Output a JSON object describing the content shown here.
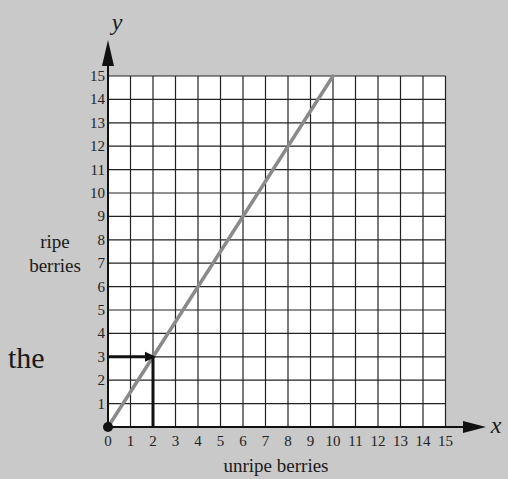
{
  "chart_data": {
    "type": "line",
    "title": "",
    "xlabel": "unripe berries",
    "ylabel": "ripe berries",
    "x_axis_symbol": "x",
    "y_axis_symbol": "y",
    "xlim": [
      0,
      15
    ],
    "ylim": [
      0,
      15
    ],
    "x_ticks": [
      0,
      1,
      2,
      3,
      4,
      5,
      6,
      7,
      8,
      9,
      10,
      11,
      12,
      13,
      14,
      15
    ],
    "y_ticks": [
      1,
      2,
      3,
      4,
      5,
      6,
      7,
      8,
      9,
      10,
      11,
      12,
      13,
      14,
      15
    ],
    "grid": true,
    "series": [
      {
        "name": "ripe vs unripe",
        "x": [
          0,
          10
        ],
        "y": [
          0,
          15
        ],
        "color": "#8a8a8a"
      }
    ],
    "annotations": [
      {
        "type": "point",
        "x": 0,
        "y": 0,
        "label": "origin"
      },
      {
        "type": "guide",
        "from_axis": "y",
        "value": 3,
        "to": [
          2,
          3
        ]
      },
      {
        "type": "guide",
        "from_axis": "x",
        "value": 2,
        "to": [
          2,
          3
        ]
      }
    ]
  },
  "side_text": "the",
  "colors": {
    "background": "#c9c9c9",
    "grid": "#222222",
    "line": "#8a8a8a",
    "guides": "#111111"
  }
}
